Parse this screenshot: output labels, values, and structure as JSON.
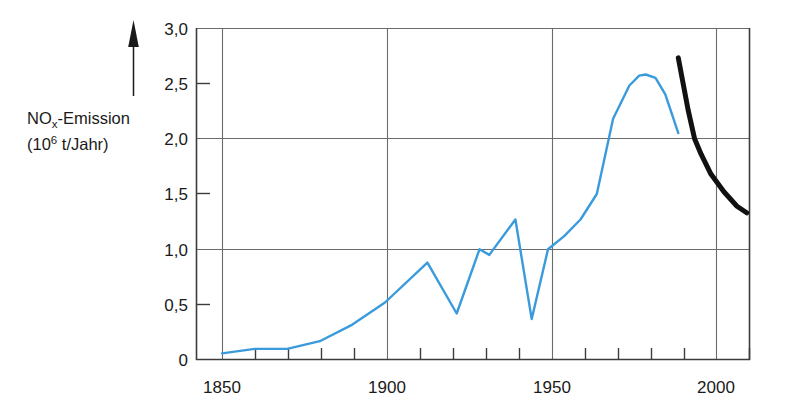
{
  "chart_data": {
    "type": "line",
    "title": "",
    "subtitle": "",
    "ylabel_line1": "NO",
    "ylabel_sub": "x",
    "ylabel_line1_rest": "-Emission",
    "ylabel_line2_open": "(10",
    "ylabel_line2_sup": "6",
    "ylabel_line2_rest": " t/Jahr)",
    "ylabel_full": "NOx-Emission (10^6 t/Jahr)",
    "xlabel": "",
    "xlim": [
      1842,
      2012
    ],
    "ylim": [
      0,
      3.0
    ],
    "xticks": [
      1850,
      1900,
      1950,
      2000
    ],
    "xtick_labels": [
      "1850",
      "1900",
      "1950",
      "2000"
    ],
    "xminor_step": 10,
    "yticks": [
      0,
      0.5,
      1.0,
      1.5,
      2.0,
      2.5,
      3.0
    ],
    "ytick_labels": [
      "0",
      "0,5",
      "1,0",
      "1,5",
      "2,0",
      "2,5",
      "3,0"
    ],
    "gridlines_y": [
      1.0,
      2.0,
      3.0
    ],
    "gridlines_x": [
      1850,
      1900,
      1950,
      2000
    ],
    "grid": true,
    "legend": "none",
    "axis_arrow": "up",
    "colors": {
      "historic_line": "#3A9BDC",
      "projection_line": "#111111",
      "axis": "#3c3c3c",
      "grid": "#6b6b6b",
      "text": "#1a1a1a",
      "background": "#ffffff"
    },
    "series": [
      {
        "name": "Historische NOx-Emission",
        "style": "solid",
        "color": "#3A9BDC",
        "width": 2.4,
        "x": [
          1850,
          1860,
          1870,
          1880,
          1890,
          1900,
          1913,
          1922,
          1929,
          1932,
          1940,
          1945,
          1950,
          1955,
          1960,
          1965,
          1970,
          1975,
          1978,
          1980,
          1983,
          1986,
          1990
        ],
        "values": [
          0.06,
          0.1,
          0.1,
          0.17,
          0.32,
          0.52,
          0.88,
          0.42,
          1.0,
          0.95,
          1.27,
          0.37,
          1.0,
          1.12,
          1.27,
          1.5,
          2.18,
          2.48,
          2.57,
          2.58,
          2.55,
          2.4,
          2.05
        ]
      },
      {
        "name": "Prognose / Szenario",
        "style": "solid-bold",
        "color": "#111111",
        "width": 5.0,
        "x": [
          1990,
          1993,
          1995,
          1997,
          2000,
          2004,
          2008,
          2011
        ],
        "values": [
          2.73,
          2.26,
          2.0,
          1.86,
          1.68,
          1.52,
          1.39,
          1.33
        ]
      }
    ]
  }
}
